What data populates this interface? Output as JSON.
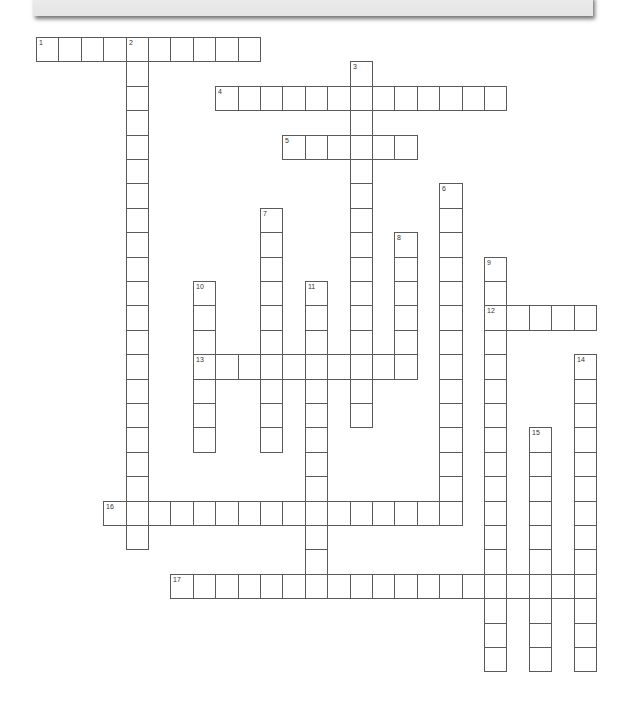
{
  "puzzle": {
    "type": "crossword",
    "grid": {
      "origin_x": 36,
      "origin_y": 37,
      "cell_w": 22.4,
      "cell_h": 24.4,
      "border_color": "#5a5a5a",
      "fill_color": "#ffffff"
    },
    "entries": [
      {
        "number": "1",
        "direction": "across",
        "row": 0,
        "col": 0,
        "length": 10
      },
      {
        "number": "2",
        "direction": "down",
        "row": 0,
        "col": 4,
        "length": 21
      },
      {
        "number": "3",
        "direction": "down",
        "row": 1,
        "col": 14,
        "length": 15
      },
      {
        "number": "4",
        "direction": "across",
        "row": 2,
        "col": 8,
        "length": 13
      },
      {
        "number": "5",
        "direction": "across",
        "row": 4,
        "col": 11,
        "length": 6
      },
      {
        "number": "6",
        "direction": "down",
        "row": 6,
        "col": 18,
        "length": 14
      },
      {
        "number": "7",
        "direction": "down",
        "row": 7,
        "col": 10,
        "length": 10
      },
      {
        "number": "8",
        "direction": "down",
        "row": 8,
        "col": 16,
        "length": 6
      },
      {
        "number": "9",
        "direction": "down",
        "row": 9,
        "col": 20,
        "length": 17
      },
      {
        "number": "10",
        "direction": "down",
        "row": 10,
        "col": 7,
        "length": 7
      },
      {
        "number": "11",
        "direction": "down",
        "row": 10,
        "col": 12,
        "length": 13
      },
      {
        "number": "12",
        "direction": "across",
        "row": 11,
        "col": 20,
        "length": 5
      },
      {
        "number": "13",
        "direction": "across",
        "row": 13,
        "col": 7,
        "length": 10
      },
      {
        "number": "14",
        "direction": "down",
        "row": 13,
        "col": 24,
        "length": 13
      },
      {
        "number": "15",
        "direction": "down",
        "row": 16,
        "col": 22,
        "length": 10
      },
      {
        "number": "16",
        "direction": "across",
        "row": 19,
        "col": 3,
        "length": 16
      },
      {
        "number": "17",
        "direction": "across",
        "row": 22,
        "col": 6,
        "length": 19
      }
    ]
  }
}
